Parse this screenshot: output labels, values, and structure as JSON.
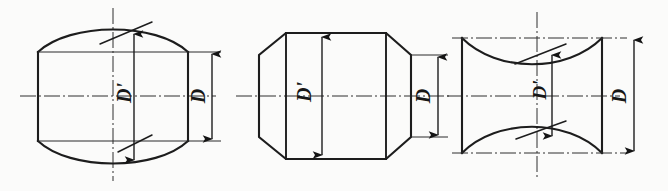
{
  "figure": {
    "type": "engineering-line-drawing",
    "background_color": "#fbfbfa",
    "line_color": "#1d1d1d",
    "panel_count": 3
  },
  "panels": [
    {
      "id": "panel-1",
      "shape_name": "barrel-convex-roller",
      "description": "Rectangular body with convex crowned top and bottom surfaces",
      "labels": {
        "inner": "D'",
        "outer": "D"
      },
      "dimensions": [
        {
          "name": "crown-diameter",
          "label": "D'",
          "style": "double-arrow-vertical",
          "leader": "oblique"
        },
        {
          "name": "nominal-diameter",
          "label": "D",
          "style": "double-arrow-vertical",
          "leader": "extension-lines"
        }
      ]
    },
    {
      "id": "panel-2",
      "shape_name": "octagonal-tapered-roller",
      "description": "Straight central band with chamfered conical ends forming an octagon outline",
      "labels": {
        "inner": "D'",
        "outer": "D"
      },
      "dimensions": [
        {
          "name": "crown-diameter",
          "label": "D'",
          "style": "double-arrow-vertical",
          "leader": "none"
        },
        {
          "name": "nominal-diameter",
          "label": "D",
          "style": "double-arrow-vertical",
          "leader": "extension-lines"
        }
      ]
    },
    {
      "id": "panel-3",
      "shape_name": "hourglass-concave-roller",
      "description": "Rectangular body with concave hollowed top and bottom surfaces",
      "labels": {
        "inner": "D'",
        "outer": "D"
      },
      "dimensions": [
        {
          "name": "waist-diameter",
          "label": "D'",
          "style": "double-arrow-vertical",
          "leader": "oblique"
        },
        {
          "name": "nominal-diameter",
          "label": "D",
          "style": "double-arrow-vertical",
          "leader": "extension-lines"
        }
      ]
    }
  ],
  "annotations": {
    "p1_inner": "D'",
    "p1_outer": "D",
    "p2_inner": "D'",
    "p2_outer": "D",
    "p3_inner": "D'",
    "p3_outer": "D"
  }
}
